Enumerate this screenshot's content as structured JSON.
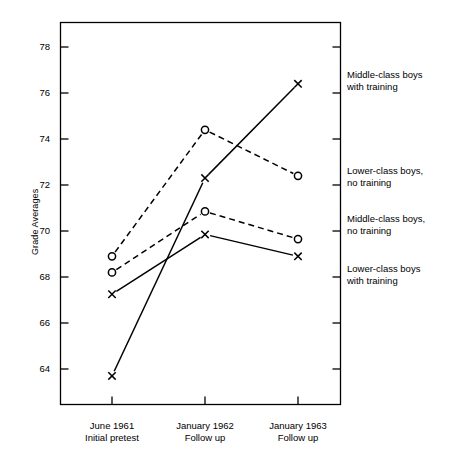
{
  "chart_data": {
    "type": "line",
    "title": "",
    "xlabel": "",
    "ylabel": "Grade Averages",
    "grid": false,
    "legend_position": "right-of-axes",
    "categories": [
      "June 1961\nInitial pretest",
      "January 1962\nFollow up",
      "January 1963\nFollow up"
    ],
    "x_tick_labels": [
      {
        "line1": "June 1961",
        "line2": "Initial pretest"
      },
      {
        "line1": "January 1962",
        "line2": "Follow up"
      },
      {
        "line1": "January 1963",
        "line2": "Follow up"
      }
    ],
    "y_tick_labels": [
      "78",
      "76",
      "74",
      "72",
      "70",
      "68",
      "66",
      "64"
    ],
    "y_ticks": [
      78,
      76,
      74,
      72,
      70,
      68,
      66,
      64
    ],
    "ylim": [
      62.5,
      78.9
    ],
    "xlim": [
      0,
      4
    ],
    "series": [
      {
        "name": "Middle-class boys with training",
        "marker": "x",
        "linestyle": "solid",
        "color": "#000000",
        "values": [
          63.7,
          72.3,
          76.4
        ]
      },
      {
        "name": "Lower-class boys, no training",
        "marker": "o",
        "linestyle": "dashed",
        "color": "#000000",
        "values": [
          68.9,
          74.4,
          72.4
        ]
      },
      {
        "name": "Middle-class boys, no training",
        "marker": "o",
        "linestyle": "dashed",
        "color": "#000000",
        "values": [
          68.2,
          70.85,
          69.65
        ]
      },
      {
        "name": "Lower-class boys with training",
        "marker": "x",
        "linestyle": "solid",
        "color": "#000000",
        "values": [
          67.25,
          69.85,
          68.9
        ]
      }
    ],
    "legend_entries": [
      {
        "line1": "Middle-class boys",
        "line2": "with training"
      },
      {
        "line1": "Lower-class boys,",
        "line2": "no training"
      },
      {
        "line1": "Middle-class boys,",
        "line2": "no training"
      },
      {
        "line1": "Lower-class boys",
        "line2": "with training"
      }
    ]
  },
  "colors": {
    "ink": "#000000",
    "background": "#ffffff",
    "frame": "#1a1a1a"
  }
}
